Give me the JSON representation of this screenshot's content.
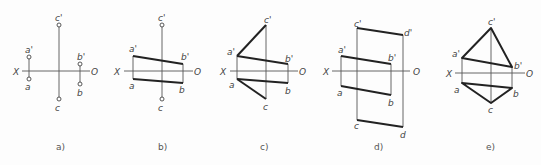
{
  "figure": {
    "panels": [
      {
        "id": "a",
        "caption": "a)",
        "axis": {
          "left": "X",
          "right": "O"
        },
        "points": {
          "a_prime": "a'",
          "a": "a",
          "b_prime": "b'",
          "b": "b",
          "c_prime": "c'",
          "c": "c"
        }
      },
      {
        "id": "b",
        "caption": "b)",
        "axis": {
          "left": "X",
          "right": "O"
        },
        "points": {
          "a_prime": "a'",
          "a": "a",
          "b_prime": "b'",
          "b": "b",
          "c_prime": "c'",
          "c": "c"
        }
      },
      {
        "id": "c",
        "caption": "c)",
        "axis": {
          "left": "X",
          "right": "O"
        },
        "points": {
          "a_prime": "a'",
          "a": "a",
          "b_prime": "b'",
          "b": "b",
          "c_prime": "c'",
          "c": "c"
        }
      },
      {
        "id": "d",
        "caption": "d)",
        "axis": {
          "left": "X",
          "right": "O"
        },
        "points": {
          "a_prime": "a'",
          "a": "a",
          "b_prime": "b'",
          "b": "b",
          "c_prime": "c'",
          "c": "c",
          "d_prime": "d'",
          "d": "d"
        }
      },
      {
        "id": "e",
        "caption": "e)",
        "axis": {
          "left": "X",
          "right": "O"
        },
        "points": {
          "a_prime": "a'",
          "a": "a",
          "b_prime": "b'",
          "b": "b",
          "c_prime": "c'",
          "c": "c"
        }
      }
    ]
  }
}
